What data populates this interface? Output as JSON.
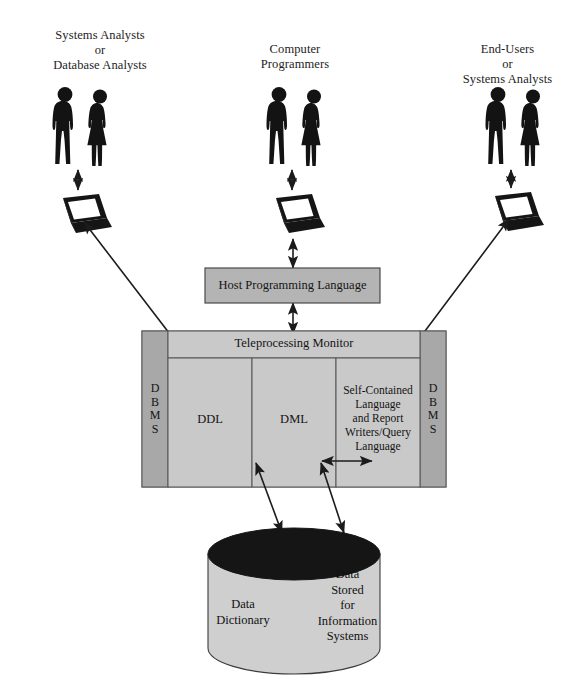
{
  "diagram": {
    "type": "architecture-diagram",
    "colors": {
      "panel_fill": "#c9c9c9",
      "dbms_bar_fill": "#a8a8a8",
      "host_box_fill": "#b4b4b4",
      "cylinder_body": "#cfcfcf",
      "cylinder_top": "#141414",
      "stroke": "#3a3a3a",
      "text": "#141414",
      "figure": "#141414"
    },
    "user_groups": [
      {
        "id": "left",
        "caption": "Systems Analysts\nor\nDatabase Analysts",
        "people_icon": "people-pair-icon",
        "terminal_icon": "laptop-icon"
      },
      {
        "id": "center",
        "caption": "Computer\nProgrammers",
        "people_icon": "people-pair-icon",
        "terminal_icon": "laptop-icon"
      },
      {
        "id": "right",
        "caption": "End-Users\nor\nSystems Analysts",
        "people_icon": "people-pair-icon",
        "terminal_icon": "laptop-icon"
      }
    ],
    "host_box": {
      "label": "Host Programming Language"
    },
    "dbms_block": {
      "header_label": "Teleprocessing Monitor",
      "left_bar_label": "D\nB\nM\nS",
      "right_bar_label": "D\nB\nM\nS",
      "panels": [
        {
          "id": "ddl",
          "label": "DDL"
        },
        {
          "id": "dml",
          "label": "DML"
        },
        {
          "id": "selfcontained",
          "label": "Self-Contained\nLanguage\nand Report\nWriters/Query\nLanguage"
        }
      ]
    },
    "database_cylinder": {
      "left_label": "Data\nDictionary",
      "right_label": "Data\nStored\nfor\nInformation\nSystems"
    },
    "connectors": [
      {
        "id": "left-people-to-terminal",
        "style": "double-headed-vertical"
      },
      {
        "id": "center-people-to-terminal",
        "style": "double-headed-vertical"
      },
      {
        "id": "right-people-to-terminal",
        "style": "double-headed-vertical"
      },
      {
        "id": "left-terminal-to-ddl",
        "style": "double-headed-diagonal"
      },
      {
        "id": "center-terminal-to-host",
        "style": "double-headed-vertical"
      },
      {
        "id": "host-to-dml",
        "style": "double-headed-vertical"
      },
      {
        "id": "right-terminal-to-selfcontained",
        "style": "double-headed-diagonal"
      },
      {
        "id": "dml-to-selfcontained",
        "style": "double-headed-horizontal"
      },
      {
        "id": "dml-to-database",
        "style": "double-headed-diagonal"
      },
      {
        "id": "selfcontained-to-database",
        "style": "double-headed-diagonal"
      }
    ]
  }
}
